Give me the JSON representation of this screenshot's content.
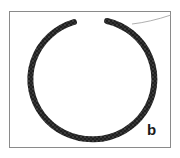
{
  "figure": {
    "panel_label": "b",
    "colors": {
      "ring": "#1f1f1f",
      "ring_highlight": "#555555",
      "frame": "#8a8a8a",
      "wire": "#9a9a9a",
      "background": "#ffffff"
    }
  }
}
